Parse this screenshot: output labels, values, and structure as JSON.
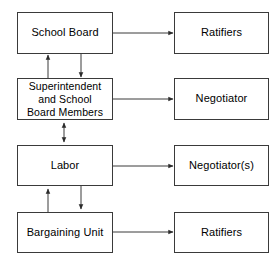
{
  "diagram": {
    "type": "flow-diagram",
    "title": "",
    "background_color": "#ffffff",
    "line_color": "#3a3a3a",
    "text_color": "#000000",
    "left_column": [
      {
        "id": "school-board",
        "label": "School Board"
      },
      {
        "id": "superintendent-and-school-board-members",
        "label": "Superintendent\nand School\nBoard Members"
      },
      {
        "id": "labor",
        "label": "Labor"
      },
      {
        "id": "bargaining-unit",
        "label": "Bargaining Unit"
      }
    ],
    "right_column": [
      {
        "id": "ratifiers-top",
        "label": "Ratifiers"
      },
      {
        "id": "negotiator",
        "label": "Negotiator"
      },
      {
        "id": "negotiators",
        "label": "Negotiator(s)"
      },
      {
        "id": "ratifiers-bottom",
        "label": "Ratifiers"
      }
    ],
    "connectors": [
      {
        "id": "school-board-to-ratifiers",
        "from": "school-board",
        "to": "ratifiers-top",
        "style": "arrow-right"
      },
      {
        "id": "superintendent-to-negotiator",
        "from": "superintendent-and-school-board-members",
        "to": "negotiator",
        "style": "arrow-right"
      },
      {
        "id": "labor-to-negotiators",
        "from": "labor",
        "to": "negotiators",
        "style": "arrow-right"
      },
      {
        "id": "bargaining-unit-to-ratifiers",
        "from": "bargaining-unit",
        "to": "ratifiers-bottom",
        "style": "arrow-right"
      },
      {
        "id": "superintendent-to-school-board",
        "from": "superintendent-and-school-board-members",
        "to": "school-board",
        "style": "arrow-up"
      },
      {
        "id": "school-board-to-superintendent",
        "from": "school-board",
        "to": "superintendent-and-school-board-members",
        "style": "arrow-down"
      },
      {
        "id": "superintendent-labor-bidirectional",
        "from": "superintendent-and-school-board-members",
        "to": "labor",
        "style": "arrow-double-vertical"
      },
      {
        "id": "bargaining-unit-to-labor",
        "from": "bargaining-unit",
        "to": "labor",
        "style": "arrow-up"
      },
      {
        "id": "labor-to-bargaining-unit",
        "from": "labor",
        "to": "bargaining-unit",
        "style": "arrow-down"
      }
    ]
  }
}
